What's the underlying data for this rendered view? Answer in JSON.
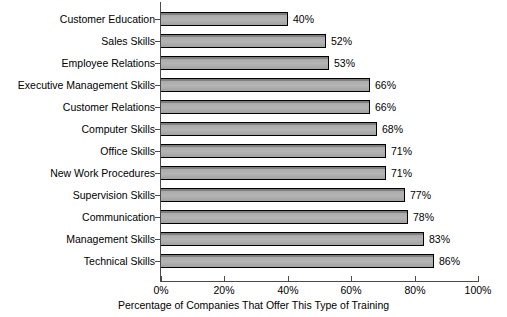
{
  "chart_data": {
    "type": "bar",
    "orientation": "horizontal",
    "title": "",
    "xlabel": "Percentage of Companies That Offer This Type of Training",
    "ylabel": "",
    "xlim": [
      0,
      100
    ],
    "xticks": [
      "0%",
      "20%",
      "40%",
      "60%",
      "80%",
      "100%"
    ],
    "xtick_values": [
      0,
      20,
      40,
      60,
      80,
      100
    ],
    "grid": false,
    "legend": false,
    "value_suffix": "%",
    "categories": [
      "Customer Education",
      "Sales Skills",
      "Employee Relations",
      "Executive Management Skills",
      "Customer Relations",
      "Computer Skills",
      "Office Skills",
      "New Work Procedures",
      "Supervision Skills",
      "Communication",
      "Management Skills",
      "Technical Skills"
    ],
    "values": [
      40,
      52,
      53,
      66,
      66,
      68,
      71,
      71,
      77,
      78,
      83,
      86
    ],
    "value_labels": [
      "40%",
      "52%",
      "53%",
      "66%",
      "66%",
      "68%",
      "71%",
      "71%",
      "77%",
      "78%",
      "83%",
      "86%"
    ],
    "bar_fill_color": "#adadad",
    "bar_edge_color": "#000000",
    "axis_color": "#4a4a4a",
    "background_color": "#ffffff"
  }
}
